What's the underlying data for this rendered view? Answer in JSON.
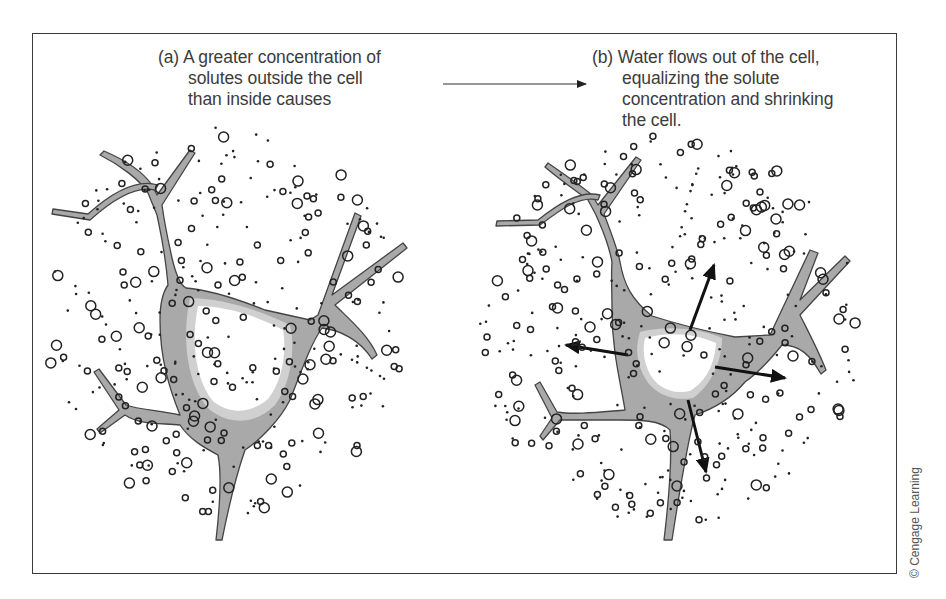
{
  "figure": {
    "panel_a": {
      "label": "(a)",
      "lines": [
        "A greater concentration of",
        "solutes outside the cell",
        "than inside causes"
      ]
    },
    "panel_b": {
      "label": "(b)",
      "lines": [
        "Water flows out of the cell,",
        "equalizing the solute",
        "concentration and shrinking",
        "the cell."
      ]
    },
    "transition_arrow": {
      "from": [
        443,
        84
      ],
      "to": [
        586,
        84
      ]
    },
    "credit": "© Cengage Learning",
    "colors": {
      "frame": "#3a3a3a",
      "text": "#3c3c3c",
      "cell_fill": "#a9a9a9",
      "cell_outline": "#444444",
      "cytoplasm": "#ffffff",
      "solute": "#222222",
      "water_arrow": "#111111"
    },
    "legend_semantics": {
      "large_circle": "solute particle",
      "small_dot": "water molecule",
      "gray_region": "cell membrane/cytoplasm",
      "arrows_b": "water flowing out"
    }
  }
}
